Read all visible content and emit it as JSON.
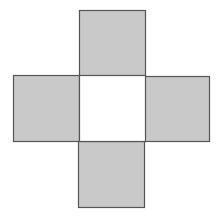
{
  "diagram": {
    "type": "cross-net",
    "colors": {
      "background": "#ffffff",
      "shaded_fill": "#c9c9c9",
      "center_fill": "#ffffff",
      "stroke": "#555555"
    },
    "squares": [
      {
        "id": "top",
        "x": 79,
        "y": 10,
        "size": 66,
        "shaded": true
      },
      {
        "id": "left",
        "x": 13,
        "y": 75,
        "size": 66,
        "shaded": true
      },
      {
        "id": "center",
        "x": 79,
        "y": 75,
        "size": 66,
        "shaded": false
      },
      {
        "id": "right",
        "x": 144,
        "y": 76,
        "size": 65,
        "shaded": true
      },
      {
        "id": "bottom",
        "x": 78,
        "y": 141,
        "size": 66,
        "shaded": true
      }
    ]
  }
}
